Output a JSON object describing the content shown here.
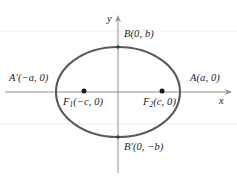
{
  "figure": {
    "colors": {
      "curve": "#5a5a5a",
      "axis": "#8c8c8c",
      "gridline": "#eceaea",
      "point": "#1b1b1b",
      "text": "#1b1b1b",
      "background": "#ffffff"
    },
    "axes": {
      "x_label": "x",
      "y_label": "y",
      "origin": {
        "x": 118,
        "y": 92
      }
    },
    "ellipse": {
      "center_x": 118,
      "center_y": 92,
      "semi_major_px": 62,
      "semi_minor_px": 45
    },
    "labels": {
      "vertex_right": {
        "name": "A",
        "prime": "",
        "coords": "(a, 0)",
        "text": "A(a, 0)"
      },
      "vertex_left": {
        "name": "A",
        "prime": "′",
        "coords": "(−a, 0)",
        "text": "A′(−a, 0)"
      },
      "vertex_top": {
        "name": "B",
        "prime": "",
        "coords": "(0, b)",
        "text": "B(0, b)"
      },
      "vertex_bottom": {
        "name": "B",
        "prime": "′",
        "coords": "(0, −b)",
        "text": "B′(0, −b)"
      },
      "focus_left": {
        "name": "F",
        "subscript": "1",
        "coords": "(−c, 0)",
        "text": "F₁(−c, 0)"
      },
      "focus_right": {
        "name": "F",
        "subscript": "2",
        "coords": "(c, 0)",
        "text": "F₂(c, 0)"
      }
    },
    "points": {
      "focus_left": {
        "x": 84,
        "y": 91
      },
      "focus_right": {
        "x": 162,
        "y": 91
      }
    }
  }
}
